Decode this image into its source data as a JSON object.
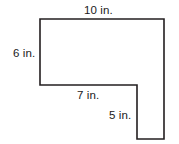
{
  "figure": {
    "name": "composite-l-shape-figure",
    "background_color": "#ffffff",
    "stroke_color": "#231f20",
    "fill_color": "#ffffff",
    "stroke_width": 1.6,
    "labels": {
      "top": "10 in.",
      "left": "6 in.",
      "bottom": "7 in.",
      "right": "5 in."
    },
    "vertices": [
      {
        "x": 40,
        "y": 19
      },
      {
        "x": 164,
        "y": 19
      },
      {
        "x": 164,
        "y": 139
      },
      {
        "x": 137,
        "y": 139
      },
      {
        "x": 137,
        "y": 85
      },
      {
        "x": 40,
        "y": 85
      }
    ]
  },
  "chart_data": {
    "type": "diagram",
    "title": "",
    "shape": "composite-rectilinear-hexagon",
    "unit": "in.",
    "sides": [
      {
        "name": "top",
        "label": "10 in.",
        "value": 10,
        "orientation": "horizontal",
        "position": "above-top-edge"
      },
      {
        "name": "left",
        "label": "6 in.",
        "value": 6,
        "orientation": "vertical",
        "position": "left-of-left-edge"
      },
      {
        "name": "inner-bottom",
        "label": "7 in.",
        "value": 7,
        "orientation": "horizontal",
        "position": "below-inner-horizontal-edge"
      },
      {
        "name": "inner-right",
        "label": "5 in.",
        "value": 5,
        "orientation": "vertical",
        "position": "left-of-lower-right-edge"
      }
    ],
    "polygon_px": [
      [
        40,
        19
      ],
      [
        164,
        19
      ],
      [
        164,
        139
      ],
      [
        137,
        139
      ],
      [
        137,
        85
      ],
      [
        40,
        85
      ]
    ],
    "legend": "none",
    "grid": false
  }
}
